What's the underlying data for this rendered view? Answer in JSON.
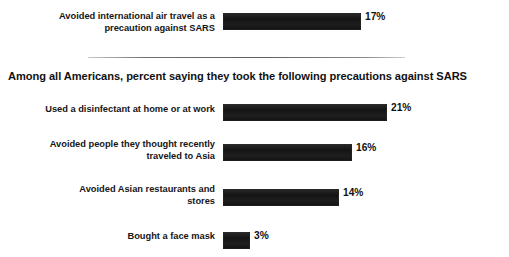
{
  "chart_data": {
    "type": "bar",
    "title": "",
    "subtitle": "",
    "xlabel": "",
    "ylabel": "",
    "orientation": "horizontal",
    "grid": false,
    "legend": false,
    "xlim": [
      0,
      25
    ],
    "unit": "%",
    "sections": [
      {
        "heading": "",
        "categories": [
          "Avoided international air travel as a precaution against SARS"
        ],
        "values": [
          17
        ],
        "value_labels": [
          "17%"
        ]
      },
      {
        "heading": "Among all Americans, percent saying they took the following precautions against SARS",
        "categories": [
          "Used a disinfectant at home or at work",
          "Avoided people they thought recently traveled to Asia",
          "Avoided Asian restaurants and stores",
          "Bought a face mask"
        ],
        "values": [
          21,
          16,
          14,
          3
        ],
        "value_labels": [
          "21%",
          "16%",
          "14%",
          "3%"
        ]
      }
    ],
    "categories": [
      "Avoided international air travel as a precaution against SARS",
      "Used a disinfectant at home or at work",
      "Avoided people they thought recently traveled to Asia",
      "Avoided Asian restaurants and stores",
      "Bought a face mask"
    ],
    "values": [
      17,
      21,
      16,
      14,
      3
    ],
    "colors": {
      "bar": "#1c1c1c",
      "text": "#151515",
      "divider": "#8c8c8c",
      "background": "#ffffff"
    }
  },
  "rows": {
    "air_travel": {
      "label_line1": "Avoided international air travel as a",
      "label_line2": "precaution against SARS",
      "value_label": "17%",
      "bar_width_px": "138"
    },
    "disinfectant": {
      "label": "Used a disinfectant at home or at work",
      "value_label": "21%",
      "bar_width_px": "164"
    },
    "avoid_people": {
      "label_line1": "Avoided people they thought recently",
      "label_line2": "traveled to Asia",
      "value_label": "16%",
      "bar_width_px": "129"
    },
    "restaurants": {
      "label_line1": "Avoided Asian restaurants and",
      "label_line2": "stores",
      "value_label": "14%",
      "bar_width_px": "116"
    },
    "face_mask": {
      "label": "Bought a face mask",
      "value_label": "3%",
      "bar_width_px": "27"
    }
  },
  "section": {
    "heading": "Among all Americans, percent saying they took the following precautions against SARS"
  }
}
